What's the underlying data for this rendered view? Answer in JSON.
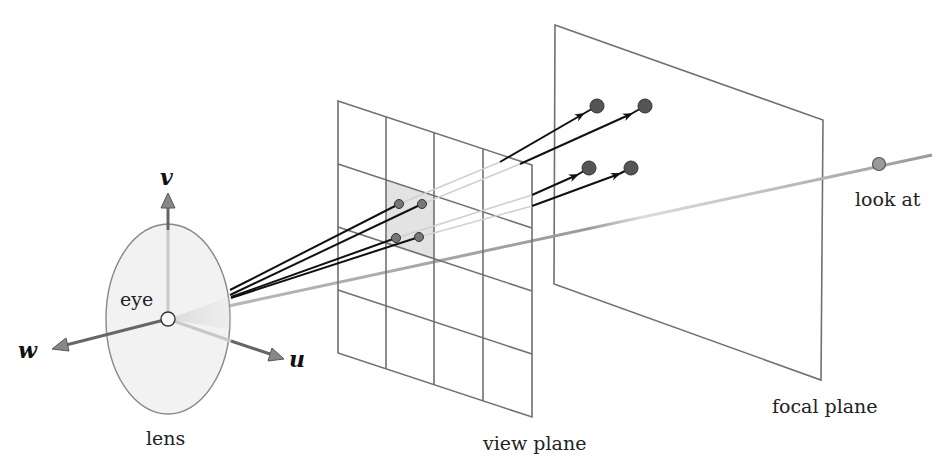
{
  "diagram": {
    "labels": {
      "v_axis": "v",
      "w_axis": "w",
      "u_axis": "u",
      "eye": "eye",
      "lens": "lens",
      "view_plane": "view plane",
      "focal_plane": "focal plane",
      "look_at": "look at"
    },
    "colors": {
      "ray": "#111111",
      "plane_edge": "#666666",
      "point_fill": "#555555",
      "highlight_cell": "#e3e3e3",
      "lens_fill": "#f2f2f2",
      "look_at_line": "#9a9a9a"
    },
    "view_plane_grid": {
      "columns": 4,
      "rows": 4,
      "highlighted_cell": {
        "column": 2,
        "row": 2
      }
    },
    "sample_points_on_view_plane": 4,
    "focal_points": 4
  }
}
